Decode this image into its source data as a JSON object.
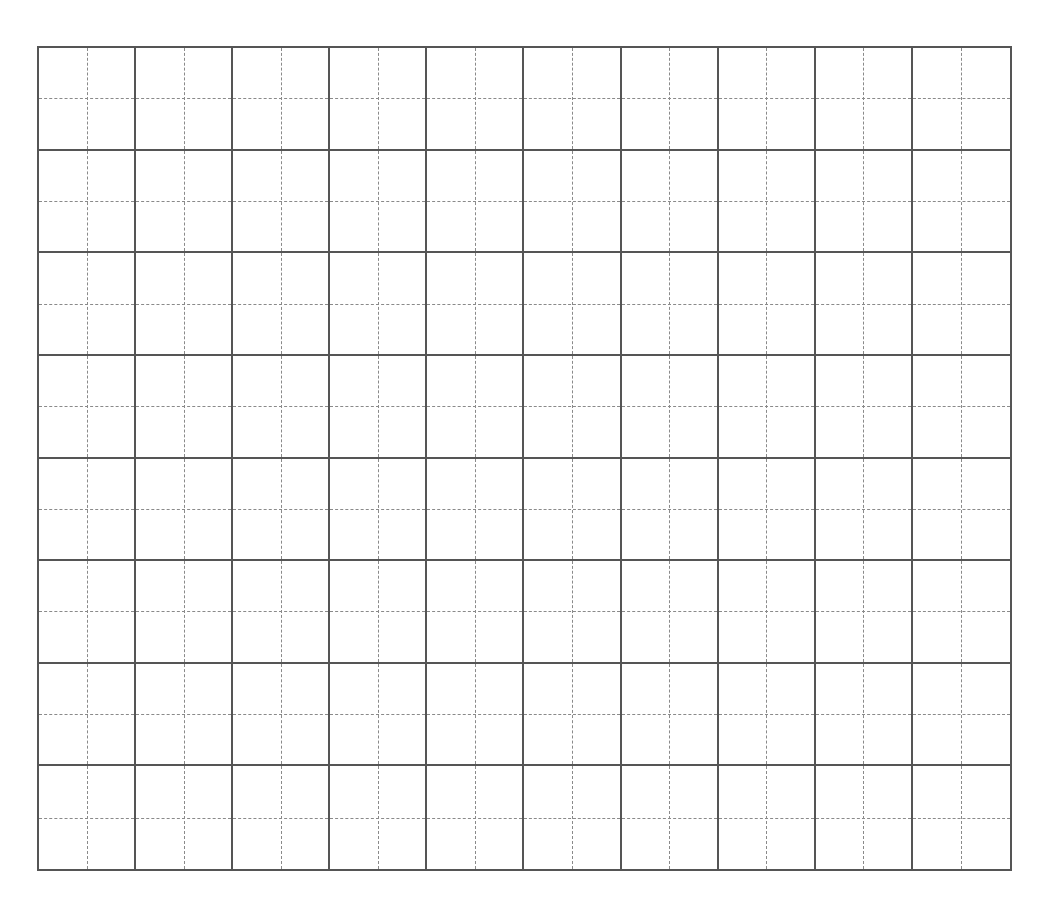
{
  "worksheet": {
    "type": "tianzige-practice-grid",
    "columns": 10,
    "rows": 8,
    "cells_filled": 0,
    "colors": {
      "background": "#ffffff",
      "solid_line": "#555555",
      "dashed_line": "#8a8a8a"
    }
  }
}
